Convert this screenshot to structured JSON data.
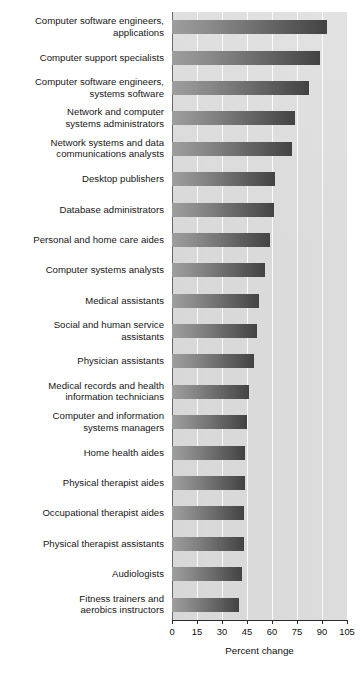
{
  "chart_data": {
    "type": "bar",
    "orientation": "horizontal",
    "title": "",
    "subtitle": "",
    "xlabel": "Percent change",
    "ylabel": "",
    "xlim": [
      0,
      105
    ],
    "xticks": [
      0,
      15,
      30,
      45,
      60,
      75,
      90,
      105
    ],
    "xtick_labels": [
      "0",
      "15",
      "30",
      "45",
      "60",
      "75",
      "90",
      "105"
    ],
    "grid": true,
    "grid_axis": "x",
    "legend": false,
    "legend_position": "none",
    "categories": [
      "Computer software engineers,\napplications",
      "Computer support specialists",
      "Computer software engineers,\nsystems software",
      "Network and computer\nsystems administrators",
      "Network systems and data\ncommunications analysts",
      "Desktop publishers",
      "Database administrators",
      "Personal and home care aides",
      "Computer systems analysts",
      "Medical assistants",
      "Social and human service\nassistants",
      "Physician assistants",
      "Medical records and health\ninformation technicians",
      "Computer and information\nsystems managers",
      "Home health aides",
      "Physical therapist aides",
      "Occupational therapist aides",
      "Physical therapist assistants",
      "Audiologists",
      "Fitness trainers and\naerobics instructors"
    ],
    "values": [
      93,
      89,
      82,
      74,
      72,
      62,
      61,
      59,
      56,
      52,
      51,
      49,
      46,
      45,
      44,
      44,
      43,
      43,
      42,
      40
    ],
    "bar_gradient": {
      "from": "#9e9e9e",
      "to": "#434343",
      "direction": "left-to-right"
    },
    "plot_background_color": "#dcdcdc",
    "gridline_color": "#fbfbfb",
    "axis_color": "#2a2a2a",
    "page_background_color": "#ffffff"
  }
}
